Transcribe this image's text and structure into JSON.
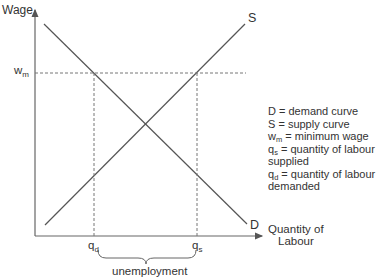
{
  "diagram": {
    "y_axis_label": "Wage",
    "x_axis_label_line1": "Quantity of",
    "x_axis_label_line2": "Labour",
    "curve_s_label": "S",
    "curve_d_label": "D",
    "wm_main": "w",
    "wm_sub": "m",
    "qd_main": "q",
    "qd_sub": "d",
    "qs_main": "q",
    "qs_sub": "s",
    "brace_label": "unemployment"
  },
  "legend": {
    "items": [
      {
        "main": "D",
        "sub": "",
        "text": " = demand curve"
      },
      {
        "main": "S",
        "sub": "",
        "text": " = supply curve"
      },
      {
        "main": "w",
        "sub": "m",
        "text": " = minimum wage"
      },
      {
        "main": "q",
        "sub": "s",
        "text": " = quantity of labour"
      },
      {
        "main": "",
        "sub": "",
        "text": "supplied"
      },
      {
        "main": "q",
        "sub": "d",
        "text": " = quantity of labour"
      },
      {
        "main": "",
        "sub": "",
        "text": "demanded"
      }
    ]
  },
  "colors": {
    "line": "#555555",
    "text": "#333333"
  }
}
